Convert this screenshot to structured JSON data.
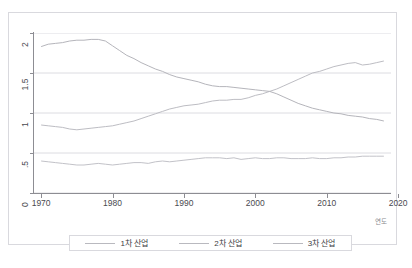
{
  "page": {
    "top_cut_text": "",
    "bottom_cut_text": ""
  },
  "figure": {
    "x_axis_title": "연도"
  },
  "legend": {
    "items": [
      {
        "label": "1차 산업",
        "color": "#b9b9bf"
      },
      {
        "label": "2차 산업",
        "color": "#b9b9bf"
      },
      {
        "label": "3차 산업",
        "color": "#b9b9bf"
      }
    ]
  },
  "chart_data": {
    "type": "line",
    "title": "",
    "xlabel": "연도",
    "ylabel": "",
    "xlim": [
      1969,
      2019
    ],
    "ylim": [
      0,
      2
    ],
    "grid": true,
    "legend_position": "bottom",
    "xticks": [
      1970,
      1980,
      1990,
      2000,
      2010,
      2020
    ],
    "yticks": [
      0,
      0.5,
      1,
      1.5,
      2
    ],
    "ytick_labels": [
      "0",
      ".5",
      "1",
      "1.5",
      "2"
    ],
    "x": [
      1970,
      1971,
      1972,
      1973,
      1974,
      1975,
      1976,
      1977,
      1978,
      1979,
      1980,
      1981,
      1982,
      1983,
      1984,
      1985,
      1986,
      1987,
      1988,
      1989,
      1990,
      1991,
      1992,
      1993,
      1994,
      1995,
      1996,
      1997,
      1998,
      1999,
      2000,
      2001,
      2002,
      2003,
      2004,
      2005,
      2006,
      2007,
      2008,
      2009,
      2010,
      2011,
      2012,
      2013,
      2014,
      2015,
      2016,
      2017,
      2018
    ],
    "series": [
      {
        "name": "1차 산업",
        "color": "#c2c2c8",
        "values": [
          0.4,
          0.39,
          0.38,
          0.37,
          0.36,
          0.35,
          0.35,
          0.36,
          0.37,
          0.36,
          0.35,
          0.36,
          0.37,
          0.38,
          0.38,
          0.37,
          0.39,
          0.4,
          0.39,
          0.4,
          0.41,
          0.42,
          0.43,
          0.44,
          0.44,
          0.44,
          0.43,
          0.44,
          0.42,
          0.43,
          0.44,
          0.43,
          0.43,
          0.44,
          0.44,
          0.43,
          0.43,
          0.43,
          0.44,
          0.43,
          0.43,
          0.44,
          0.44,
          0.45,
          0.45,
          0.46,
          0.46,
          0.46,
          0.46
        ]
      },
      {
        "name": "2차 산업",
        "color": "#bdbdc3",
        "values": [
          0.85,
          0.84,
          0.83,
          0.82,
          0.8,
          0.79,
          0.8,
          0.81,
          0.82,
          0.83,
          0.84,
          0.86,
          0.88,
          0.9,
          0.93,
          0.96,
          0.99,
          1.02,
          1.05,
          1.07,
          1.09,
          1.1,
          1.11,
          1.13,
          1.15,
          1.16,
          1.16,
          1.17,
          1.17,
          1.19,
          1.22,
          1.24,
          1.27,
          1.3,
          1.34,
          1.38,
          1.42,
          1.46,
          1.5,
          1.52,
          1.55,
          1.58,
          1.6,
          1.62,
          1.63,
          1.6,
          1.61,
          1.63,
          1.65
        ]
      },
      {
        "name": "3차 산업",
        "color": "#b5b5bb",
        "values": [
          1.83,
          1.86,
          1.87,
          1.88,
          1.9,
          1.91,
          1.91,
          1.92,
          1.92,
          1.9,
          1.84,
          1.78,
          1.72,
          1.68,
          1.63,
          1.59,
          1.55,
          1.52,
          1.48,
          1.45,
          1.43,
          1.41,
          1.39,
          1.36,
          1.34,
          1.33,
          1.33,
          1.32,
          1.31,
          1.3,
          1.29,
          1.28,
          1.27,
          1.24,
          1.2,
          1.16,
          1.12,
          1.09,
          1.06,
          1.04,
          1.02,
          1.0,
          0.99,
          0.97,
          0.96,
          0.95,
          0.93,
          0.92,
          0.9
        ]
      }
    ]
  }
}
